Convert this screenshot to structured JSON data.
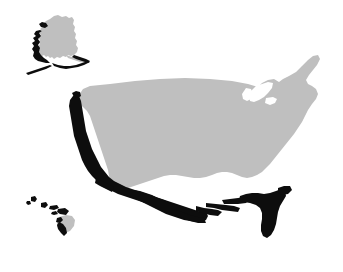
{
  "figure": {
    "title": "United States coastal highlight map",
    "description": "Stylized map of the United States including Alaska and Hawaii. The landmass is filled light gray on a white background. The Pacific coast, the Gulf of Mexico coast, Florida, the southern Alaskan coast with the Aleutian chain, and the Hawaiian islands are highlighted in solid black and separated from the gray interior by a thin white gap.",
    "width": 343,
    "height": 272
  },
  "colors": {
    "background": "#ffffff",
    "land_fill": "#bfbfbf",
    "highlight_fill": "#0d0d0d",
    "separator_gap": "#ffffff"
  },
  "regions": [
    {
      "id": "contiguous-united-states",
      "label": "Contiguous United States",
      "fill": "#bfbfbf",
      "highlighted": false
    },
    {
      "id": "alaska",
      "label": "Alaska",
      "fill": "#bfbfbf",
      "highlighted": false
    },
    {
      "id": "hawaii-big-island",
      "label": "Hawaii big island",
      "fill": "#bfbfbf",
      "highlighted": false
    }
  ],
  "highlights": [
    {
      "id": "pacific-coast",
      "label": "Pacific coast",
      "fill": "#0d0d0d"
    },
    {
      "id": "gulf-coast",
      "label": "Gulf of Mexico coast",
      "fill": "#0d0d0d"
    },
    {
      "id": "florida",
      "label": "Florida",
      "fill": "#0d0d0d"
    },
    {
      "id": "alaska-south-coast",
      "label": "Southern Alaska and Aleutian Islands",
      "fill": "#0d0d0d"
    },
    {
      "id": "hawaiian-islands",
      "label": "Hawaiian Islands",
      "fill": "#0d0d0d"
    }
  ],
  "legend": {
    "visible": false,
    "items": []
  },
  "labels": {
    "visible": false,
    "items": []
  }
}
